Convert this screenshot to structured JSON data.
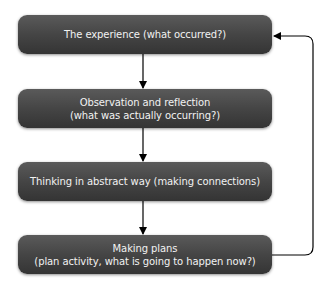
{
  "diagram": {
    "type": "flowchart-cycle",
    "colors": {
      "box_fill_top": "#5a5a5a",
      "box_fill_bottom": "#343434",
      "box_text": "#f2f2f2",
      "connector": "#000000",
      "background": "#ffffff"
    },
    "nodes": [
      {
        "id": "experience",
        "line1": "The experience (what occurred?)",
        "line2": ""
      },
      {
        "id": "observation",
        "line1": "Observation and reflection",
        "line2": "(what was actually occurring?)"
      },
      {
        "id": "abstract",
        "line1": "Thinking in abstract way (making connections)",
        "line2": ""
      },
      {
        "id": "plans",
        "line1": "Making plans",
        "line2": "(plan activity, what is going to happen now?)"
      }
    ],
    "edges": [
      {
        "from": "experience",
        "to": "observation"
      },
      {
        "from": "observation",
        "to": "abstract"
      },
      {
        "from": "abstract",
        "to": "plans"
      },
      {
        "from": "plans",
        "to": "experience",
        "route": "right-side loop back"
      }
    ]
  }
}
